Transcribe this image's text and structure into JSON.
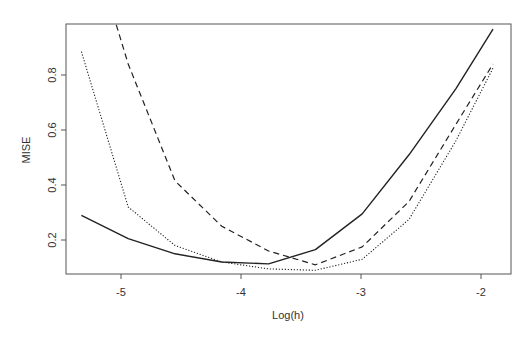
{
  "chart_data": {
    "type": "line",
    "title": "",
    "xlabel": "Log(h)",
    "ylabel": "MISE",
    "xlim": [
      -5.45,
      -1.75
    ],
    "ylim": [
      0.07,
      0.99
    ],
    "grid": false,
    "legend": null,
    "x_ticks": [
      -5,
      -4,
      -3,
      -2
    ],
    "x_tick_labels": [
      "-5",
      "-4",
      "-3",
      "-2"
    ],
    "y_ticks": [
      0.2,
      0.4,
      0.6,
      0.8
    ],
    "y_tick_labels": [
      "0.2",
      "0.4",
      "0.6",
      "0.8"
    ],
    "x": [
      -5.33,
      -4.94,
      -4.55,
      -4.16,
      -3.77,
      -3.38,
      -2.99,
      -2.6,
      -2.21,
      -1.9
    ],
    "series": [
      {
        "name": "solid",
        "line_style": "solid",
        "color": "#222222",
        "values": [
          0.29,
          0.205,
          0.15,
          0.12,
          0.113,
          0.165,
          0.295,
          0.51,
          0.75,
          0.967
        ]
      },
      {
        "name": "dashed",
        "line_style": "dashed",
        "color": "#222222",
        "values": [
          1.4,
          0.84,
          0.415,
          0.25,
          0.16,
          0.11,
          0.175,
          0.34,
          0.62,
          0.84
        ]
      },
      {
        "name": "dotted",
        "line_style": "dotted",
        "color": "#222222",
        "values": [
          0.885,
          0.32,
          0.18,
          0.12,
          0.095,
          0.09,
          0.13,
          0.275,
          0.56,
          0.825
        ]
      }
    ]
  }
}
